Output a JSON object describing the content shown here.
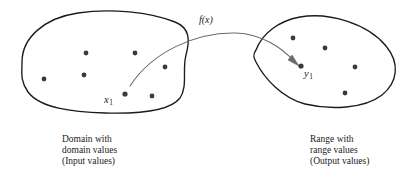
{
  "figure": {
    "background_color": "#ffffff",
    "stroke_color": "#1b1b1b",
    "arrow_color": "#5a5a5a",
    "dot_color": "#3a3a3a"
  },
  "labels": {
    "function_label": "f(x)",
    "input_element": "x",
    "input_subscript": "1",
    "output_element": "y",
    "output_subscript": "1"
  },
  "domain_caption": {
    "line1": "Domain with",
    "line2": "domain values",
    "line3": "(Input values)"
  },
  "range_caption": {
    "line1": "Range with",
    "line2": "range values",
    "line3": "(Output values)"
  },
  "domain_set": {
    "name": "domain-blob",
    "points": [
      {
        "x": 86,
        "y": 53
      },
      {
        "x": 135,
        "y": 53
      },
      {
        "x": 44,
        "y": 79
      },
      {
        "x": 84,
        "y": 75
      },
      {
        "x": 165,
        "y": 67
      },
      {
        "x": 125,
        "y": 94
      },
      {
        "x": 152,
        "y": 96
      }
    ]
  },
  "range_set": {
    "name": "range-blob",
    "points": [
      {
        "x": 293,
        "y": 38
      },
      {
        "x": 325,
        "y": 48
      },
      {
        "x": 355,
        "y": 67
      },
      {
        "x": 345,
        "y": 93
      },
      {
        "x": 301,
        "y": 66
      }
    ]
  },
  "mapping_arrow": {
    "from": {
      "x": 130,
      "y": 86
    },
    "to": {
      "x": 299,
      "y": 65
    },
    "peak": {
      "x": 215,
      "y": 33
    }
  }
}
